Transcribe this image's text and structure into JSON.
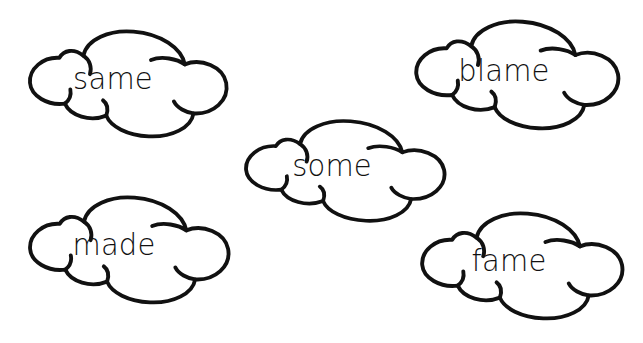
{
  "page": {
    "background_color": "#ffffff",
    "outline_color": "#111111",
    "text_color": "#111111",
    "width": 643,
    "height": 343
  },
  "clouds": [
    {
      "word": "same",
      "x": 18,
      "y": 24,
      "width": 218,
      "height": 120,
      "font_size": 29,
      "text_dx": -14,
      "text_dy": -6
    },
    {
      "word": "blame",
      "x": 404,
      "y": 14,
      "width": 224,
      "height": 122,
      "font_size": 29,
      "text_dx": -12,
      "text_dy": -5
    },
    {
      "word": "some",
      "x": 234,
      "y": 114,
      "width": 220,
      "height": 114,
      "font_size": 29,
      "text_dx": -12,
      "text_dy": -6
    },
    {
      "word": "made",
      "x": 18,
      "y": 190,
      "width": 220,
      "height": 120,
      "font_size": 29,
      "text_dx": -14,
      "text_dy": -6
    },
    {
      "word": "fame",
      "x": 410,
      "y": 206,
      "width": 222,
      "height": 120,
      "font_size": 29,
      "text_dx": -12,
      "text_dy": -6
    }
  ]
}
